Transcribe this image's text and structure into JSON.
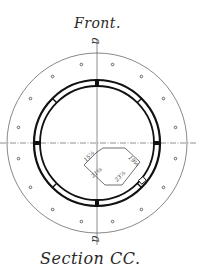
{
  "drawing": {
    "title_top": "Front.",
    "title_bottom": "Section CC.",
    "axis_label_top": "a",
    "axis_label_bottom": "a",
    "colors": {
      "ink": "#2a2a2a",
      "paper": "#ffffff"
    },
    "dimensions": {
      "upper_left": "15⅞",
      "upper_right": "19⅛",
      "lower_left": "21⅛",
      "lower_right": "23⅞"
    },
    "geometry": {
      "center": [
        97,
        143
      ],
      "flange_radius": 90,
      "bolt_circle_radius": 80,
      "bolt_count": 16,
      "ring_outer_radius": 63,
      "ring_inner_radius": 57
    }
  }
}
